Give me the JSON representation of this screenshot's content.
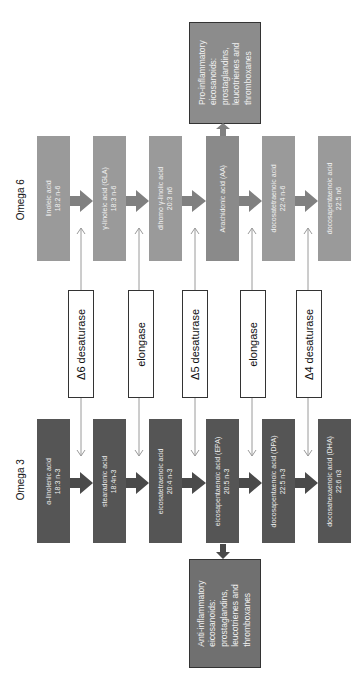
{
  "labels": {
    "omega6": "Omega 6",
    "omega3": "Omega 3"
  },
  "omega6": [
    {
      "name": "linoleic acid",
      "formula": "18:2 n-6"
    },
    {
      "name": "γ-linoleic acid (GLA)",
      "formula": "18:3 n-6"
    },
    {
      "name": "dihomo γ-linolic acid",
      "formula": "20:3 n6"
    },
    {
      "name": "Arachidonic acid (AA)",
      "formula": ""
    },
    {
      "name": "docosatetraenoic acid",
      "formula": "22:4 n-6"
    },
    {
      "name": "docosapentaenoic acid",
      "formula": "22:5 n6"
    }
  ],
  "omega3": [
    {
      "name": "α-linolenic acid",
      "formula": "18:3 n-3"
    },
    {
      "name": "stearadonic acid",
      "formula": "18:4n-3"
    },
    {
      "name": "eicosatetraenoic acid",
      "formula": "20:4 n-3"
    },
    {
      "name": "eicosapentaenoic acid (EPA)",
      "formula": "20:5 n-3"
    },
    {
      "name": "docosapentaenoic acid (DPA)",
      "formula": "22:5 n-3"
    },
    {
      "name": "docosahexaenoic acid (DHA)",
      "formula": "22:6 n3"
    }
  ],
  "enzymes": [
    "Δ6 desaturase",
    "elongase",
    "Δ5 desaturase",
    "elongase",
    "Δ4 desaturase"
  ],
  "outputs": {
    "pro": [
      "Pro-inflammatory",
      "eicosanoids:",
      "prostaglandins,",
      "leucotrienes and",
      "thromboxanes"
    ],
    "anti": [
      "Anti-inflammatory",
      "eicosanoids:",
      "prostaglandins,",
      "leucotrienes and",
      "thromboxanes"
    ]
  },
  "colors": {
    "omega6_box": "#9a9a9a",
    "omega3_box": "#555555",
    "enzyme_border": "#333333",
    "arrow_line": "#9a9a9a"
  }
}
